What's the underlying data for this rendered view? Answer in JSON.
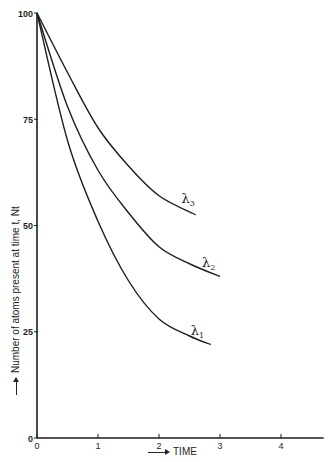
{
  "chart_data": {
    "type": "line",
    "title": "",
    "xlabel": "TIME",
    "ylabel": "Number of atoms present at time t, Nt",
    "xlim": [
      0,
      4.7
    ],
    "ylim": [
      0,
      100
    ],
    "grid": false,
    "legend": "inline labels at curve ends",
    "x_ticks": [
      "0",
      "1",
      "2",
      "3",
      "4"
    ],
    "y_ticks": [
      "0",
      "25",
      "50",
      "75",
      "100"
    ],
    "series": [
      {
        "name": "λ3",
        "label_main": "λ",
        "label_sub": "3",
        "x": [
          0,
          0.5,
          1,
          1.5,
          2,
          2.6
        ],
        "y": [
          100,
          86,
          73,
          64,
          57,
          52.5
        ]
      },
      {
        "name": "λ2",
        "label_main": "λ",
        "label_sub": "2",
        "x": [
          0,
          0.5,
          1,
          1.5,
          2,
          2.5,
          3.0
        ],
        "y": [
          100,
          78,
          63,
          53,
          45,
          41,
          38
        ]
      },
      {
        "name": "λ1",
        "label_main": "λ",
        "label_sub": "1",
        "x": [
          0,
          0.5,
          1,
          1.5,
          2,
          2.5,
          2.85
        ],
        "y": [
          100,
          70,
          51,
          37,
          28,
          24,
          22
        ]
      }
    ]
  }
}
